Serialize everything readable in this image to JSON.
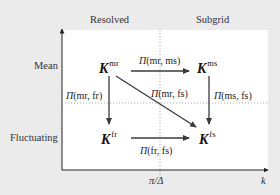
{
  "columns": {
    "resolved": "Resolved",
    "subgrid": "Subgrid"
  },
  "rows": {
    "mean": "Mean",
    "fluctuating": "Fluctuating"
  },
  "axes": {
    "x_label": "k",
    "x_marker": "π/Δ"
  },
  "nodes": {
    "mr": {
      "symbol": "K",
      "sup": "mr"
    },
    "ms": {
      "symbol": "K",
      "sup": "ms"
    },
    "fr": {
      "symbol": "K",
      "sup": "fr"
    },
    "fs": {
      "symbol": "K",
      "sup": "fs"
    }
  },
  "transfers": {
    "mr_ms": {
      "symbol": "Π",
      "args": "(mr, ms)"
    },
    "mr_fr": {
      "symbol": "Π",
      "args": "(mr, fr)"
    },
    "mr_fs": {
      "symbol": "Π",
      "args": "(mr, fs)"
    },
    "ms_fs": {
      "symbol": "Π",
      "args": "(ms, fs)"
    },
    "fr_fs": {
      "symbol": "Π",
      "args": "(fr, fs)"
    }
  },
  "colors": {
    "background": "#ebebeb",
    "panel": "#ffffff",
    "arrow": "#3a3a3a",
    "divider": "#9a9a9a"
  }
}
